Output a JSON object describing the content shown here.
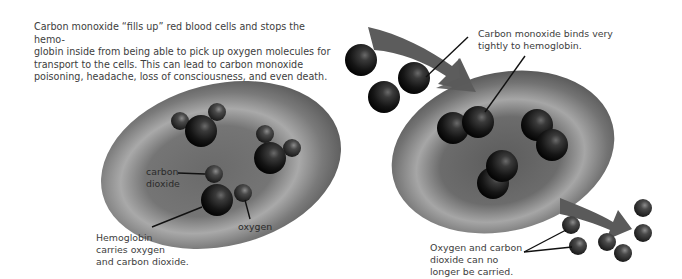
{
  "intro": {
    "lines": [
      "Carbon monoxide “fills up” red blood cells and stops the hemo-",
      "globin inside from being able to pick up oxygen molecules for",
      "transport to the cells. This can lead to carbon monoxide",
      "poisoning, headache, loss of consciousness, and even death."
    ]
  },
  "left_cell": {
    "labels": {
      "carbon_dioxide": [
        "carbon",
        "dioxide"
      ],
      "oxygen": "oxygen",
      "hemoglobin": [
        "Hemoglobin",
        "carries oxygen",
        "and carbon dioxide."
      ]
    }
  },
  "right_cell": {
    "labels": {
      "binds": [
        "Carbon monoxide binds very",
        "tightly to hemoglobin."
      ],
      "no_longer": [
        "Oxygen and carbon",
        "dioxide can no",
        "longer be carried."
      ]
    }
  },
  "colors": {
    "cell": "#6e6e6e",
    "cell_highlight": "#b5b5b5",
    "molecule": "#1e1e1e",
    "arrow": "#5a5a5a",
    "text": "#3d3d3d"
  }
}
